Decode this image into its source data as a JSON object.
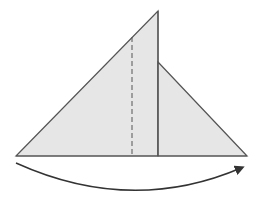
{
  "diagram": {
    "type": "origami-fold-step",
    "colors": {
      "paper_fill": "#e6e6e6",
      "edge_stroke": "#555555",
      "arrow_stroke": "#333333",
      "background": "#ffffff"
    },
    "shapes": {
      "left_triangle": "16,156 158,11 158,156",
      "right_flap": "158,62 247,156 158,156"
    },
    "lines": {
      "fold_line_dashed": {
        "x1": 132,
        "y1": 37,
        "x2": 132,
        "y2": 156
      },
      "center_edge": {
        "x1": 158,
        "y1": 11,
        "x2": 158,
        "y2": 156
      },
      "base_edge": {
        "x1": 16,
        "y1": 156,
        "x2": 247,
        "y2": 156
      }
    },
    "arrow": {
      "path": "M16,163 Q131,215 241,168",
      "direction": "left-to-right"
    }
  }
}
